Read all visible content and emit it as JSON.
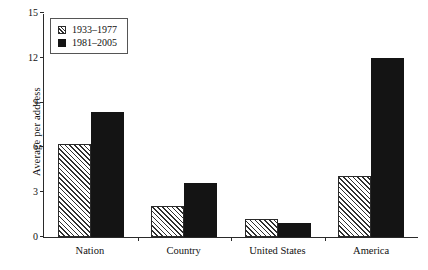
{
  "chart_data": {
    "type": "bar",
    "title": "",
    "xlabel": "",
    "ylabel": "Average per address",
    "categories": [
      "Nation",
      "Country",
      "United States",
      "America"
    ],
    "series": [
      {
        "name": "1933–1977",
        "style": "hatched",
        "color": "#2f2f2f",
        "values": [
          6.2,
          2.1,
          1.2,
          4.1
        ]
      },
      {
        "name": "1981–2005",
        "style": "solid",
        "color": "#141414",
        "values": [
          8.4,
          3.6,
          0.95,
          12.0
        ]
      }
    ],
    "ylim": [
      0,
      15
    ],
    "yticks": [
      0,
      3,
      6,
      9,
      12,
      15
    ],
    "ytick_labels": [
      "0",
      "3",
      "6",
      "9",
      "12",
      "15"
    ],
    "grid": false,
    "legend_position": "top-left"
  }
}
